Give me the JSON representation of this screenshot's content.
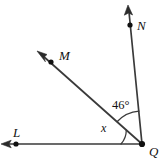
{
  "figure": {
    "type": "geometry-angle-diagram",
    "width": 165,
    "height": 160,
    "background_color": "#ffffff",
    "line_color": "#3a3a3a",
    "label_color": "#111111"
  },
  "vertex": {
    "name": "Q",
    "label": "Q",
    "x": 142,
    "y": 144,
    "label_x": 149,
    "label_y": 145
  },
  "rays": [
    {
      "id": "ray-qn",
      "label": "N",
      "endpoint_label": "N",
      "tip_x": 128,
      "tip_y": 6,
      "dot_x": 130,
      "dot_y": 25,
      "label_x": 137,
      "label_y": 19,
      "has_arrow": true,
      "has_dot": true
    },
    {
      "id": "ray-qm",
      "label": "M",
      "endpoint_label": "M",
      "tip_x": 38,
      "tip_y": 52,
      "dot_x": 51,
      "dot_y": 62,
      "label_x": 59,
      "label_y": 49,
      "has_arrow": true,
      "has_dot": true
    },
    {
      "id": "ray-ql",
      "label": "L",
      "endpoint_label": "L",
      "tip_x": 2,
      "tip_y": 144,
      "dot_x": 16,
      "dot_y": 144,
      "label_x": 13,
      "label_y": 126,
      "has_arrow": true,
      "has_dot": true
    }
  ],
  "angles": [
    {
      "id": "angle-mqn",
      "label": "46°",
      "value": 46,
      "unit": "degrees",
      "between": "M and N",
      "arc_radius": 33,
      "label_x": 112,
      "label_y": 99
    },
    {
      "id": "angle-lqm",
      "label": "x",
      "value": "x",
      "unit": "unknown",
      "between": "L and M",
      "arc_radius": 21,
      "label_x": 101,
      "label_y": 122
    }
  ]
}
